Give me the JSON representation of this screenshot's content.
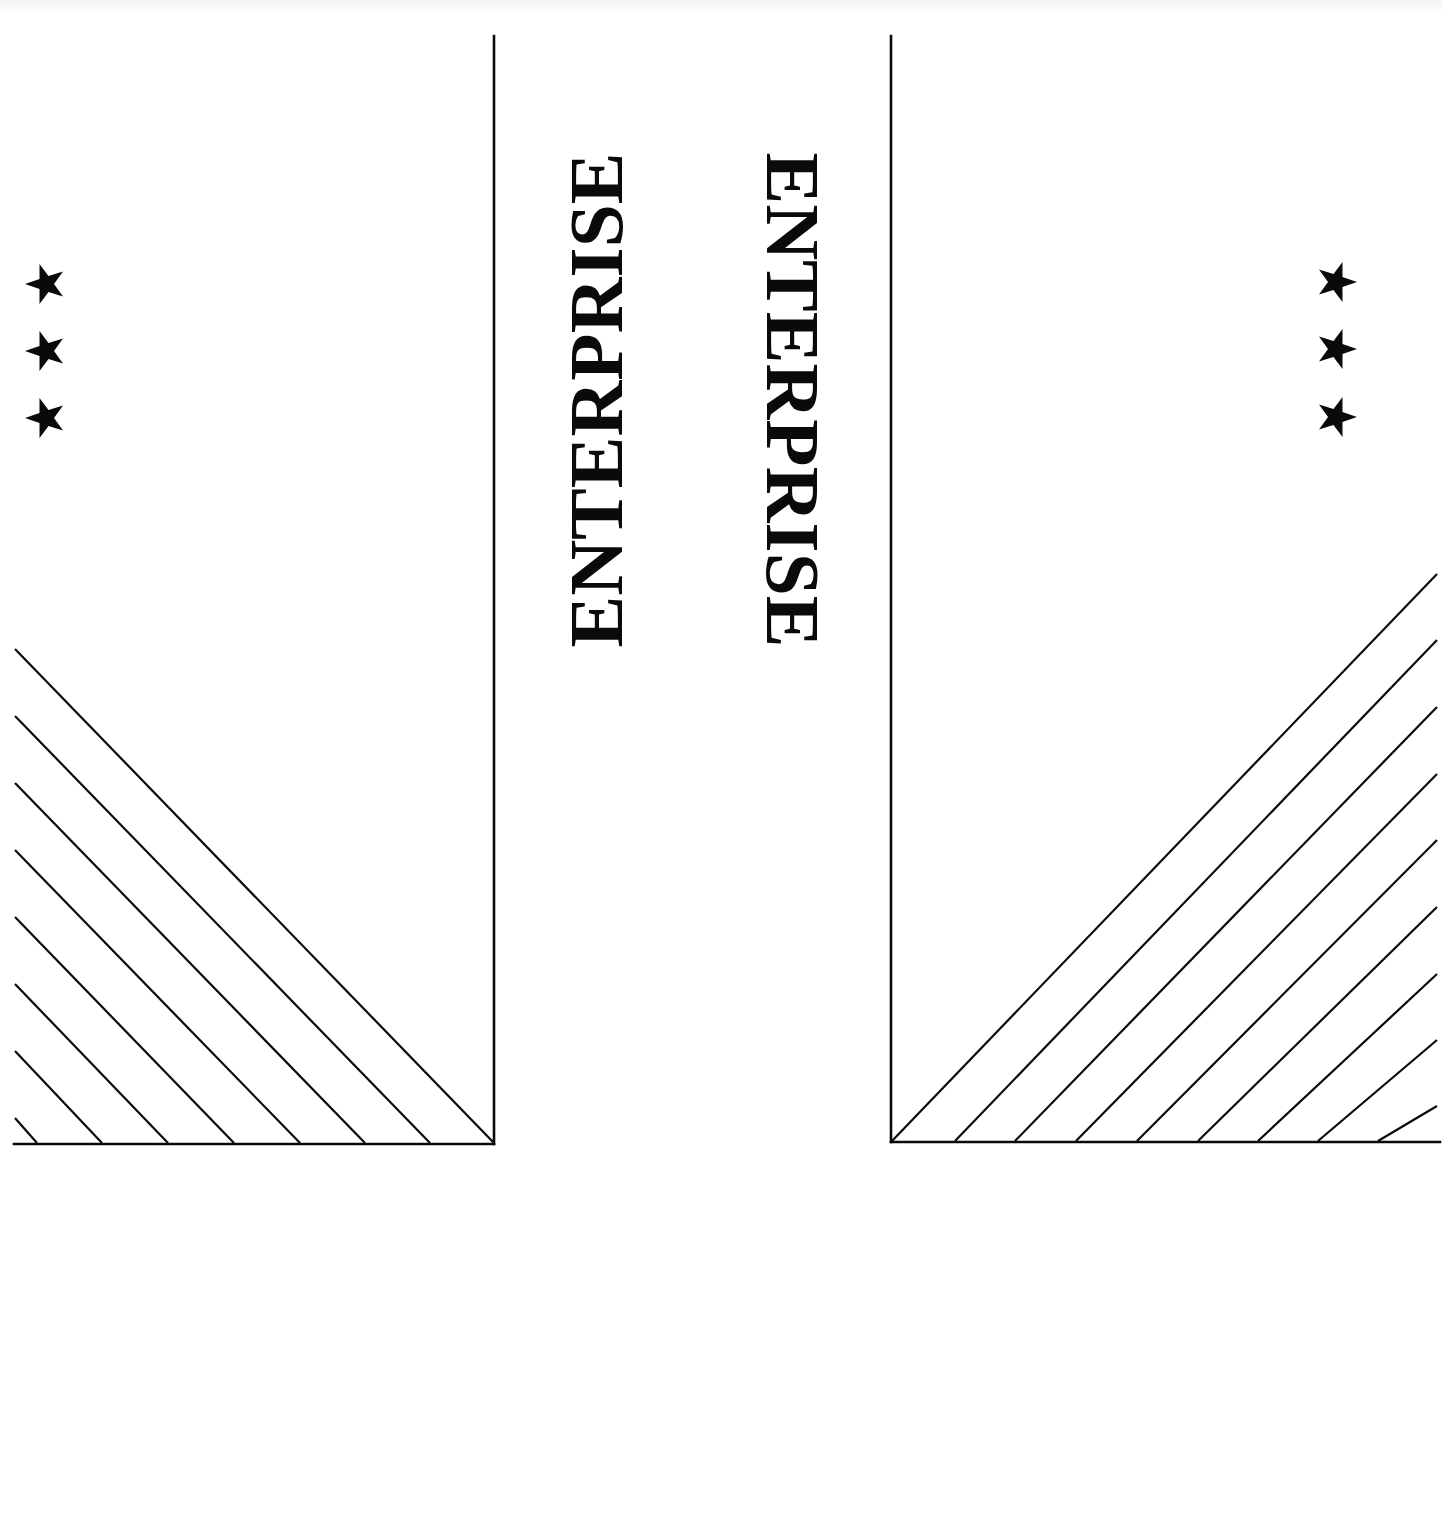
{
  "page": {
    "background": "#ffffff",
    "ink": "#0a0a0a"
  },
  "left_panel": {
    "title": "ENTERPRISE",
    "title_orientation": "rotated-90-ccw",
    "stars": [
      "star",
      "star",
      "star"
    ],
    "star_count": 3,
    "hatch_line_count": 8,
    "hatch_direction": "down-right"
  },
  "right_panel": {
    "title": "ENTERPRISE",
    "title_orientation": "rotated-90-cw",
    "stars": [
      "star",
      "star",
      "star"
    ],
    "star_count": 3,
    "hatch_line_count": 9,
    "hatch_direction": "up-right"
  }
}
